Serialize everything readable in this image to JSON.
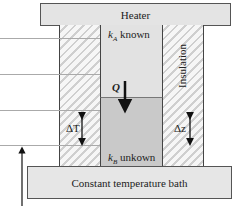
{
  "diagram": {
    "heater": {
      "label": "Heater"
    },
    "bath": {
      "label": "Constant temperature bath"
    },
    "insulation": {
      "label": "Insulation"
    },
    "sample_a": {
      "symbol": "k",
      "subscript": "A",
      "text": "known"
    },
    "sample_b": {
      "symbol": "k",
      "subscript": "B",
      "text": "unkown"
    },
    "heat_flow": {
      "label": "Q",
      "direction": "down"
    },
    "delta_t": {
      "label": "ΔT"
    },
    "delta_z": {
      "label": "Δz"
    },
    "colors": {
      "heater_fill": "#e4e4e4",
      "bath_fill": "#e6e6e6",
      "sample_a_fill": "#e2e2e2",
      "sample_b_fill": "#c9c9c9",
      "insulation_hatch": "#cfcfcf",
      "outline": "#444444"
    }
  }
}
